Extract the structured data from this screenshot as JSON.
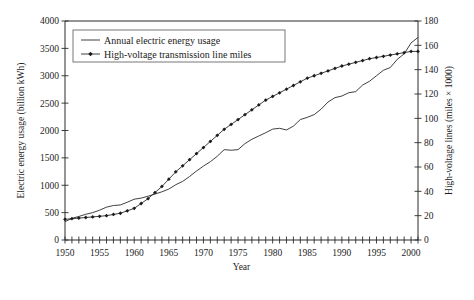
{
  "chart_data": {
    "type": "line",
    "title": "",
    "xlabel": "Year",
    "ylabel": "Electric energy usage (billion kWh)",
    "y2label": "High-voltage lines (miles × 1000)",
    "xlim": [
      1950,
      2001
    ],
    "ylim": [
      0,
      4000
    ],
    "y2lim": [
      0,
      180
    ],
    "grid": false,
    "legend_position": "top-left-inside",
    "x_ticks_labeled": [
      1950,
      1955,
      1960,
      1965,
      1970,
      1975,
      1980,
      1985,
      1990,
      1995,
      2000
    ],
    "x_tick_interval": 1,
    "y_ticks": [
      0,
      500,
      1000,
      1500,
      2000,
      2500,
      3000,
      3500,
      4000
    ],
    "y2_ticks": [
      0,
      20,
      40,
      60,
      80,
      100,
      120,
      140,
      160,
      180
    ],
    "x": [
      1950,
      1951,
      1952,
      1953,
      1954,
      1955,
      1956,
      1957,
      1958,
      1959,
      1960,
      1961,
      1962,
      1963,
      1964,
      1965,
      1966,
      1967,
      1968,
      1969,
      1970,
      1971,
      1972,
      1973,
      1974,
      1975,
      1976,
      1977,
      1978,
      1979,
      1980,
      1981,
      1982,
      1983,
      1984,
      1985,
      1986,
      1987,
      1988,
      1989,
      1990,
      1991,
      1992,
      1993,
      1994,
      1995,
      1996,
      1997,
      1998,
      1999,
      2000,
      2001
    ],
    "series": [
      {
        "name": "Annual electric energy usage",
        "axis": "left",
        "units": "billion kWh",
        "marker": "none",
        "values": [
          335,
          395,
          430,
          470,
          500,
          545,
          600,
          630,
          640,
          690,
          745,
          765,
          800,
          840,
          880,
          930,
          1010,
          1070,
          1160,
          1260,
          1350,
          1430,
          1530,
          1650,
          1640,
          1650,
          1760,
          1840,
          1900,
          1960,
          2025,
          2040,
          2010,
          2080,
          2200,
          2240,
          2290,
          2390,
          2520,
          2600,
          2630,
          2690,
          2710,
          2830,
          2900,
          3000,
          3100,
          3150,
          3300,
          3400,
          3600,
          3700
        ]
      },
      {
        "name": "High-voltage transmission line miles",
        "axis": "right",
        "units": "miles × 1000",
        "marker": "filled-diamond",
        "values": [
          17,
          17.5,
          18,
          18.5,
          19,
          19.5,
          20,
          21,
          22,
          24,
          26,
          30,
          34,
          39,
          44,
          50,
          56,
          61,
          66,
          71,
          76,
          81,
          86,
          91,
          95,
          99,
          103,
          107,
          111,
          115,
          118,
          121,
          124,
          127,
          130,
          133,
          135,
          137,
          139,
          141,
          143,
          144.5,
          146,
          147.5,
          149,
          150,
          151,
          152,
          153,
          154,
          155,
          155
        ]
      }
    ]
  },
  "legend": {
    "entries": [
      {
        "label": "Annual electric energy usage",
        "marker": "plain-line"
      },
      {
        "label": "High-voltage transmission line miles",
        "marker": "line-with-diamond"
      }
    ]
  },
  "axes": {
    "x_label": "Year",
    "y_left_label": "Electric energy usage (billion kWh)",
    "y_right_label": "High-voltage lines (miles × 1000)"
  },
  "colors": {
    "line": "#2a2a2a",
    "marker": "#1b1b1b",
    "axis": "#2b2b2b",
    "text": "#1a1a1a",
    "background": "#ffffff"
  }
}
